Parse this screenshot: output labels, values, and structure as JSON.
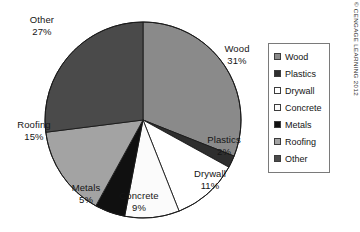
{
  "figure": {
    "name": "construction-waste-composition-pie-chart",
    "copyright": "© CENGAGE LEARNING 2012"
  },
  "legend": {
    "position": "right",
    "items": [
      {
        "label": "Wood",
        "color": "#8a8a8a"
      },
      {
        "label": "Plastics",
        "color": "#2e2e2e"
      },
      {
        "label": "Drywall",
        "color": "#ffffff"
      },
      {
        "label": "Concrete",
        "color": "#fbfbfb"
      },
      {
        "label": "Metals",
        "color": "#101010"
      },
      {
        "label": "Roofing",
        "color": "#a3a3a3"
      },
      {
        "label": "Other",
        "color": "#4a4a4a"
      }
    ]
  },
  "labels": {
    "wood": {
      "name": "Wood",
      "pct": "31%"
    },
    "plastics": {
      "name": "Plastics",
      "pct": "2%"
    },
    "drywall": {
      "name": "Drywall",
      "pct": "11%"
    },
    "concrete": {
      "name": "Concrete",
      "pct": "9%"
    },
    "metals": {
      "name": "Metals",
      "pct": "5%"
    },
    "roofing": {
      "name": "Roofing",
      "pct": "15%"
    },
    "other": {
      "name": "Other",
      "pct": "27%"
    }
  },
  "chart_data": {
    "type": "pie",
    "title": "",
    "xlabel": "",
    "ylabel": "",
    "categories": [
      "Wood",
      "Plastics",
      "Drywall",
      "Concrete",
      "Metals",
      "Roofing",
      "Other"
    ],
    "values": [
      31,
      2,
      11,
      9,
      5,
      15,
      27
    ],
    "value_labels": [
      "31%",
      "2%",
      "11%",
      "9%",
      "5%",
      "15%",
      "27%"
    ],
    "unit": "percent",
    "total": 100,
    "start_angle_deg": 0,
    "direction": "clockwise",
    "grid": false,
    "legend": "right",
    "colors": [
      "#8a8a8a",
      "#2e2e2e",
      "#ffffff",
      "#fbfbfb",
      "#101010",
      "#a3a3a3",
      "#4a4a4a"
    ],
    "annotations": [
      "© CENGAGE LEARNING 2012"
    ]
  }
}
